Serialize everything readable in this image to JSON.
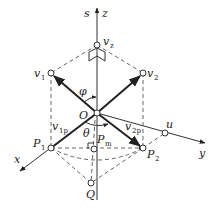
{
  "figure": {
    "type": "vector-geometry-diagram",
    "labels": {
      "s": "s",
      "z": "z",
      "vz": "v",
      "vz_sub": "z",
      "v1": "v",
      "v1_sub": "1",
      "v2": "v",
      "v2_sub": "2",
      "phi": "φ",
      "O": "O",
      "v1p": "v",
      "v1p_sub": "1p",
      "v2p": "v",
      "v2p_sub": "2p",
      "theta": "θ",
      "Pm": "P",
      "Pm_sub": "m",
      "P1": "P",
      "P1_sub": "1",
      "P2": "P",
      "P2_sub": "2",
      "u": "u",
      "x": "x",
      "y": "y",
      "Q": "Q"
    },
    "points": {
      "O": [
        97,
        113
      ],
      "vz": [
        97,
        45
      ],
      "v1": [
        51,
        73
      ],
      "v2": [
        143,
        73
      ],
      "P1": [
        51,
        148
      ],
      "P2": [
        143,
        148
      ],
      "Pm": [
        94,
        149
      ],
      "Q": [
        91,
        183
      ],
      "u": [
        165,
        133
      ]
    },
    "colors": {
      "line": "#333333",
      "background": "#ffffff"
    }
  }
}
